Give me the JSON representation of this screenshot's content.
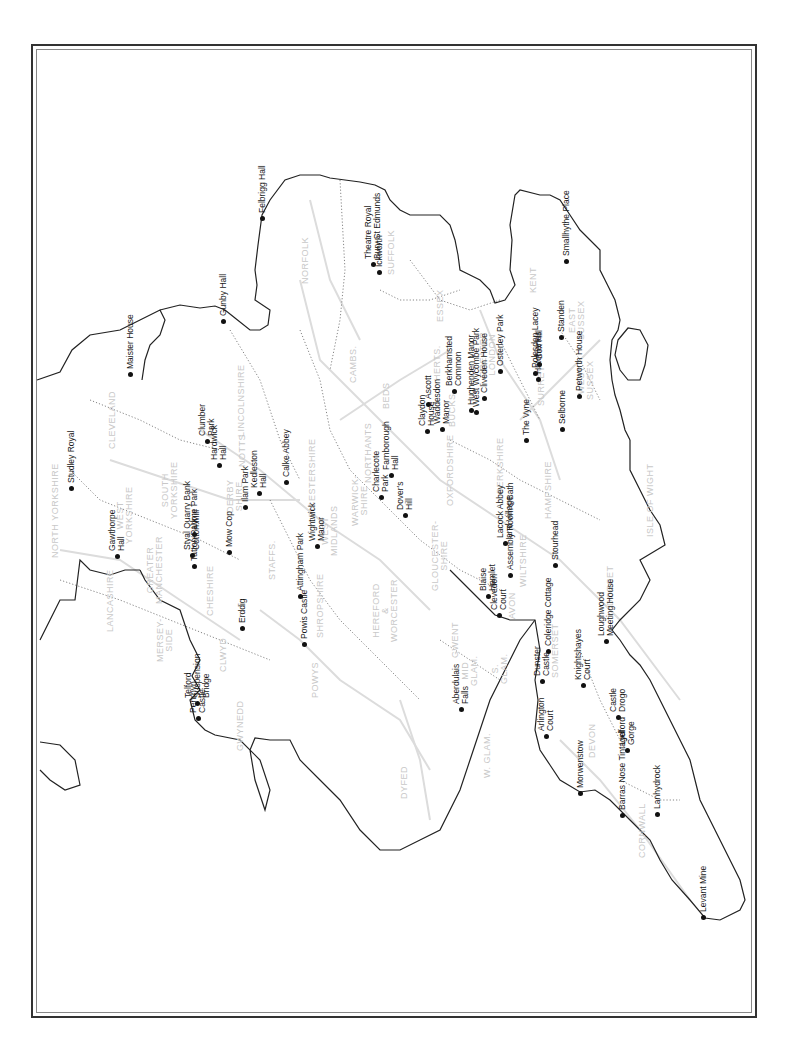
{
  "map": {
    "title": "",
    "orientation": "rotated-90-ccw",
    "colors": {
      "coast": "#222222",
      "county_boundary": "#888888",
      "roads": "#d8d8d8",
      "county_label": "#c8c8c8",
      "site": "#111111"
    }
  },
  "counties": [
    {
      "label": "NORFOLK",
      "x": 305,
      "y": 260
    },
    {
      "label": "SUFFOLK",
      "x": 391,
      "y": 252
    },
    {
      "label": "CAMBS.",
      "x": 353,
      "y": 364
    },
    {
      "label": "ESSEX",
      "x": 440,
      "y": 305
    },
    {
      "label": "HERTS.",
      "x": 437,
      "y": 363
    },
    {
      "label": "BEDS",
      "x": 386,
      "y": 395
    },
    {
      "label": "GREATER\nLONDON",
      "x": 488,
      "y": 355
    },
    {
      "label": "KENT",
      "x": 533,
      "y": 280
    },
    {
      "label": "EAST\nSUSSEX",
      "x": 577,
      "y": 320
    },
    {
      "label": "WEST\nSUSSEX",
      "x": 586,
      "y": 380
    },
    {
      "label": "SURREY",
      "x": 541,
      "y": 385
    },
    {
      "label": "BUCKS",
      "x": 452,
      "y": 410
    },
    {
      "label": "BERKSHIRE",
      "x": 500,
      "y": 465
    },
    {
      "label": "HAMPSHIRE",
      "x": 548,
      "y": 490
    },
    {
      "label": "ISLE OF WIGHT",
      "x": 650,
      "y": 500
    },
    {
      "label": "OXFORDSHIRE",
      "x": 450,
      "y": 470
    },
    {
      "label": "NORTHANTS",
      "x": 368,
      "y": 453
    },
    {
      "label": "LEICESTERSHIRE",
      "x": 312,
      "y": 480
    },
    {
      "label": "LINCOLNSHIRE",
      "x": 241,
      "y": 400
    },
    {
      "label": "NOTTS",
      "x": 242,
      "y": 450
    },
    {
      "label": "DERBY\nSHIRE",
      "x": 235,
      "y": 496
    },
    {
      "label": "SOUTH\nYORKSHIRE",
      "x": 170,
      "y": 490
    },
    {
      "label": "WEST\nYORKSHIRE",
      "x": 125,
      "y": 515
    },
    {
      "label": "NORTH YORKSHIRE",
      "x": 55,
      "y": 510
    },
    {
      "label": "CLEVELAND",
      "x": 112,
      "y": 420
    },
    {
      "label": "LANCASHIRE",
      "x": 110,
      "y": 600
    },
    {
      "label": "GREATER\nMANCHESTER",
      "x": 155,
      "y": 570
    },
    {
      "label": "MERSEY-\nSIDE",
      "x": 165,
      "y": 640
    },
    {
      "label": "CHESHIRE",
      "x": 210,
      "y": 590
    },
    {
      "label": "STAFFS.",
      "x": 272,
      "y": 560
    },
    {
      "label": "WEST\nMIDLANDS",
      "x": 330,
      "y": 530
    },
    {
      "label": "WARWICK-\nSHIRE",
      "x": 360,
      "y": 500
    },
    {
      "label": "SHROPSHIRE",
      "x": 320,
      "y": 605
    },
    {
      "label": "HEREFORD\n&\nWORCESTER",
      "x": 385,
      "y": 610
    },
    {
      "label": "GLOUCESTER-\nSHIRE",
      "x": 440,
      "y": 555
    },
    {
      "label": "WILTSHIRE",
      "x": 523,
      "y": 560
    },
    {
      "label": "AVON",
      "x": 512,
      "y": 605
    },
    {
      "label": "SOMERSET",
      "x": 555,
      "y": 650
    },
    {
      "label": "DORSET",
      "x": 610,
      "y": 585
    },
    {
      "label": "DEVON",
      "x": 592,
      "y": 740
    },
    {
      "label": "CORNWALL",
      "x": 642,
      "y": 830
    },
    {
      "label": "CLWYD",
      "x": 223,
      "y": 655
    },
    {
      "label": "GWYNEDD",
      "x": 240,
      "y": 725
    },
    {
      "label": "POWYS",
      "x": 315,
      "y": 680
    },
    {
      "label": "DYFED",
      "x": 404,
      "y": 782
    },
    {
      "label": "GWENT",
      "x": 455,
      "y": 640
    },
    {
      "label": "MID\nGLAM.",
      "x": 470,
      "y": 670
    },
    {
      "label": "S.\nGLAM.",
      "x": 500,
      "y": 668
    },
    {
      "label": "W. GLAM.",
      "x": 487,
      "y": 755
    }
  ],
  "sites": [
    {
      "name": "Felbrigg Hall",
      "x": 262,
      "y": 218
    },
    {
      "name": "Theatre Royal\nBury St Edmunds",
      "x": 373,
      "y": 264
    },
    {
      "name": "Ickworth",
      "x": 379,
      "y": 272
    },
    {
      "name": "Gunby Hall",
      "x": 223,
      "y": 321
    },
    {
      "name": "Smallhythe Place",
      "x": 566,
      "y": 261
    },
    {
      "name": "Standen",
      "x": 561,
      "y": 337
    },
    {
      "name": "Box Hill",
      "x": 539,
      "y": 364
    },
    {
      "name": "Polesden Lacey",
      "x": 535,
      "y": 373
    },
    {
      "name": "Hatchlands",
      "x": 538,
      "y": 379
    },
    {
      "name": "Osterley Park",
      "x": 500,
      "y": 371
    },
    {
      "name": "Petworth House",
      "x": 579,
      "y": 396
    },
    {
      "name": "Selborne",
      "x": 562,
      "y": 429
    },
    {
      "name": "The Vyne",
      "x": 526,
      "y": 440
    },
    {
      "name": "Cliveden House",
      "x": 484,
      "y": 398
    },
    {
      "name": "Berkhamsted\nCommon",
      "x": 454,
      "y": 391
    },
    {
      "name": "Hughenden Manor",
      "x": 471,
      "y": 410
    },
    {
      "name": "West Wycombe Park",
      "x": 476,
      "y": 412
    },
    {
      "name": "Ascott",
      "x": 428,
      "y": 404
    },
    {
      "name": "Claydon\nHouse",
      "x": 427,
      "y": 431
    },
    {
      "name": "Waddesdon\nManor",
      "x": 442,
      "y": 429
    },
    {
      "name": "Farnborough\nHall",
      "x": 391,
      "y": 475
    },
    {
      "name": "Charlecote\nPark",
      "x": 381,
      "y": 497
    },
    {
      "name": "Dover's\nHill",
      "x": 405,
      "y": 515
    },
    {
      "name": "Calke Abbey",
      "x": 286,
      "y": 482
    },
    {
      "name": "Kedleston\nHall",
      "x": 259,
      "y": 493
    },
    {
      "name": "Ilam Park",
      "x": 245,
      "y": 507
    },
    {
      "name": "Hardwick\nHall",
      "x": 219,
      "y": 465
    },
    {
      "name": "Clumber\nPark",
      "x": 207,
      "y": 441
    },
    {
      "name": "Wightwick\nManor",
      "x": 317,
      "y": 546
    },
    {
      "name": "Attingham Park",
      "x": 300,
      "y": 596
    },
    {
      "name": "Powis Castle",
      "x": 304,
      "y": 644
    },
    {
      "name": "Erddig",
      "x": 242,
      "y": 628
    },
    {
      "name": "Mow Cop",
      "x": 229,
      "y": 552
    },
    {
      "name": "Lyme Park",
      "x": 194,
      "y": 534
    },
    {
      "name": "Styal Quarry Bank\nCotton Mill",
      "x": 192,
      "y": 555
    },
    {
      "name": "Tatton Park",
      "x": 194,
      "y": 566
    },
    {
      "name": "Studley Royal",
      "x": 71,
      "y": 488
    },
    {
      "name": "Gawthorpe\nHall",
      "x": 117,
      "y": 556
    },
    {
      "name": "Maister House",
      "x": 130,
      "y": 374
    },
    {
      "name": "Telford\nSuspension\nBridge",
      "x": 197,
      "y": 703
    },
    {
      "name": "Penrhyn\nCastle",
      "x": 198,
      "y": 718
    },
    {
      "name": "Aberdulais\nFalls",
      "x": 461,
      "y": 709
    },
    {
      "name": "Lacock Abbey\nand Village",
      "x": 505,
      "y": 543
    },
    {
      "name": "Assembly Room's Bath",
      "x": 510,
      "y": 575
    },
    {
      "name": "Blaise\nHamlet",
      "x": 488,
      "y": 596
    },
    {
      "name": "Clevedon\nCourt",
      "x": 499,
      "y": 615
    },
    {
      "name": "Stourhead",
      "x": 555,
      "y": 565
    },
    {
      "name": "Coleridge Cottage",
      "x": 548,
      "y": 651
    },
    {
      "name": "Dunster\nCastle",
      "x": 542,
      "y": 681
    },
    {
      "name": "Knightshayes\nCourt",
      "x": 583,
      "y": 685
    },
    {
      "name": "Loughwood\nMeeting House",
      "x": 606,
      "y": 641
    },
    {
      "name": "Arlington\nCourt",
      "x": 546,
      "y": 736
    },
    {
      "name": "Castle\nDrogo",
      "x": 618,
      "y": 717
    },
    {
      "name": "Lydford\nGorge",
      "x": 627,
      "y": 750
    },
    {
      "name": "Morwenstow",
      "x": 580,
      "y": 793
    },
    {
      "name": "Barras Nose Tintagel",
      "x": 622,
      "y": 815
    },
    {
      "name": "Lanhydrock",
      "x": 657,
      "y": 814
    },
    {
      "name": "Levant Mine",
      "x": 703,
      "y": 917
    }
  ]
}
